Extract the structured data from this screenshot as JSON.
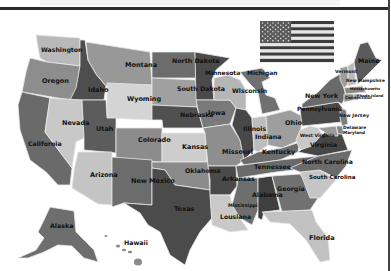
{
  "map": {
    "title": "United States map",
    "colors": {
      "background": "#ffffff",
      "state_border": "#e8e8e8",
      "label": "#111111",
      "top_rule": "#2b2b2b"
    },
    "flag": {
      "name": "us-flag",
      "x": 260,
      "y": 21,
      "w": 74,
      "h": 41
    },
    "states": [
      {
        "id": "WA",
        "label": "Washington",
        "fill": "#b9b9b9",
        "lx": 41,
        "ly": 52,
        "fs": 6.2,
        "points": "36,35 80,38 80,66 47,62 40,58 38,48"
      },
      {
        "id": "OR",
        "label": "Oregon",
        "fill": "#8d8d8d",
        "lx": 42,
        "ly": 83,
        "fs": 6.5,
        "points": "30,58 47,62 80,66 76,92 70,100 22,92 26,72"
      },
      {
        "id": "CA",
        "label": "California",
        "fill": "#6a6a6a",
        "lx": 28,
        "ly": 146,
        "fs": 6.2,
        "points": "22,92 50,98 45,132 72,168 70,185 58,185 46,172 30,160 20,130 18,105"
      },
      {
        "id": "ID",
        "label": "Idaho",
        "fill": "#4e4e4e",
        "lx": 88,
        "ly": 92,
        "fs": 6.5,
        "points": "80,40 85,40 88,60 96,74 106,86 104,100 70,100 76,88 80,66"
      },
      {
        "id": "NV",
        "label": "Nevada",
        "fill": "#c8c8c8",
        "lx": 62,
        "ly": 125,
        "fs": 6.5,
        "points": "50,98 82,100 84,138 76,142 72,168 45,132"
      },
      {
        "id": "MT",
        "label": "Montana",
        "fill": "#989898",
        "lx": 125,
        "ly": 67,
        "fs": 6.5,
        "points": "86,42 150,52 152,85 106,86 96,74 88,60"
      },
      {
        "id": "WY",
        "label": "Wyoming",
        "fill": "#d4d4d4",
        "lx": 127,
        "ly": 101,
        "fs": 6.5,
        "points": "107,83 152,85 152,120 107,118"
      },
      {
        "id": "UT",
        "label": "Utah",
        "fill": "#5c5c5c",
        "lx": 96,
        "ly": 131,
        "fs": 6.5,
        "points": "82,100 106,100 107,118 116,118 116,153 84,150 84,138"
      },
      {
        "id": "AZ",
        "label": "Arizona",
        "fill": "#c4c4c4",
        "lx": 90,
        "ly": 177,
        "fs": 6.5,
        "points": "78,152 112,152 112,205 98,204 72,188 74,170"
      },
      {
        "id": "CO",
        "label": "Colorado",
        "fill": "#8c8c8c",
        "lx": 138,
        "ly": 142,
        "fs": 6.5,
        "points": "116,128 162,128 162,162 116,160"
      },
      {
        "id": "NM",
        "label": "New Mexico",
        "fill": "#6c6c6c",
        "lx": 131,
        "ly": 183,
        "fs": 6.5,
        "points": "112,157 152,160 152,205 124,203 112,207"
      },
      {
        "id": "ND",
        "label": "North Dakota",
        "fill": "#6c6c6c",
        "lx": 172,
        "ly": 63,
        "fs": 6.3,
        "points": "152,52 195,52 196,78 152,78"
      },
      {
        "id": "SD",
        "label": "South Dakota",
        "fill": "#a0a0a0",
        "lx": 177,
        "ly": 91,
        "fs": 6.3,
        "points": "152,78 196,80 197,107 152,105"
      },
      {
        "id": "NE",
        "label": "Nebraska",
        "fill": "#505050",
        "lx": 180,
        "ly": 117,
        "fs": 6.3,
        "points": "152,105 197,107 203,128 163,128 162,120 152,120"
      },
      {
        "id": "KS",
        "label": "Kansas",
        "fill": "#cdcdcd",
        "lx": 182,
        "ly": 149,
        "fs": 6.5,
        "points": "162,133 205,133 207,162 162,162"
      },
      {
        "id": "OK",
        "label": "Oklahoma",
        "fill": "#8a8a8a",
        "lx": 185,
        "ly": 173,
        "fs": 6.3,
        "points": "152,162 208,162 210,190 190,187 175,185 165,170 152,168"
      },
      {
        "id": "TX",
        "label": "Texas",
        "fill": "#4b4b4b",
        "lx": 174,
        "ly": 211,
        "fs": 6.5,
        "points": "152,168 165,170 175,185 210,190 212,218 200,232 190,250 185,265 170,255 160,232 148,225 140,213 124,203 152,205"
      },
      {
        "id": "MN",
        "label": "Minnesota",
        "fill": "#4a4a4a",
        "lx": 205,
        "ly": 75,
        "fs": 6,
        "points": "195,52 230,58 216,70 212,80 214,100 196,100"
      },
      {
        "id": "IA",
        "label": "Iowa",
        "fill": "#7a7a7a",
        "lx": 208,
        "ly": 115,
        "fs": 6.5,
        "points": "196,100 230,100 236,108 230,124 203,128 198,110"
      },
      {
        "id": "MO",
        "label": "Missouri",
        "fill": "#8e8e8e",
        "lx": 222,
        "ly": 154,
        "fs": 6.5,
        "points": "203,128 230,124 240,140 244,160 236,166 208,166 205,133"
      },
      {
        "id": "AR",
        "label": "Arkansas",
        "fill": "#4a4a4a",
        "lx": 222,
        "ly": 181,
        "fs": 6.3,
        "points": "208,166 236,166 237,186 230,195 210,195 210,180"
      },
      {
        "id": "LA",
        "label": "Lousiana",
        "fill": "#c9c9c9",
        "lx": 220,
        "ly": 219,
        "fs": 6.2,
        "points": "210,195 230,195 232,205 240,218 248,230 230,232 212,225"
      },
      {
        "id": "WI",
        "label": "Wisconsin",
        "fill": "#b6b6b6",
        "lx": 232,
        "ly": 93,
        "fs": 6.2,
        "points": "214,78 228,75 240,80 246,90 246,110 236,108 230,100 214,100"
      },
      {
        "id": "IL",
        "label": "Illinois",
        "fill": "#484848",
        "lx": 243,
        "ly": 131,
        "fs": 6.2,
        "points": "236,108 246,110 252,118 254,150 244,160 240,140 232,125"
      },
      {
        "id": "MI",
        "label": "Michigan",
        "fill": "#707070",
        "lx": 247,
        "ly": 75,
        "fs": 6,
        "points": "240,72 262,68 270,78 262,82 266,95 275,98 280,110 262,114 258,92 250,84"
      },
      {
        "id": "IN",
        "label": "Indiana",
        "fill": "#bdbdbd",
        "lx": 255,
        "ly": 139,
        "fs": 6.3,
        "points": "252,118 266,116 268,145 258,152 254,150"
      },
      {
        "id": "OH",
        "label": "Ohio",
        "fill": "#9e9e9e",
        "lx": 285,
        "ly": 125,
        "fs": 6.5,
        "points": "266,116 290,110 302,116 300,140 282,148 268,145"
      },
      {
        "id": "KY",
        "label": "Kentucky",
        "fill": "#6c6c6c",
        "lx": 262,
        "ly": 154,
        "fs": 6.3,
        "points": "240,160 258,152 282,148 300,142 298,152 280,160 244,165"
      },
      {
        "id": "TN",
        "label": "Tennessee",
        "fill": "#6a6a6a",
        "lx": 254,
        "ly": 169,
        "fs": 6.3,
        "points": "236,166 280,160 318,156 312,168 276,172 238,178"
      },
      {
        "id": "MS",
        "label": "Mississippi",
        "fill": "#6e6e6e",
        "lx": 228,
        "ly": 207,
        "fs": 4.8,
        "points": "238,178 258,178 258,210 252,225 240,218 232,205 237,186"
      },
      {
        "id": "AL",
        "label": "Alabama",
        "fill": "#3f3f3f",
        "lx": 252,
        "ly": 197,
        "fs": 6.3,
        "points": "258,178 272,176 280,210 264,212 262,220 258,218"
      },
      {
        "id": "GA",
        "label": "Georgia",
        "fill": "#717171",
        "lx": 277,
        "ly": 191,
        "fs": 6.3,
        "points": "272,176 300,174 318,198 310,210 282,212"
      },
      {
        "id": "FL",
        "label": "Florida",
        "fill": "#c2c2c2",
        "lx": 309,
        "ly": 240,
        "fs": 6.5,
        "points": "262,212 312,210 316,222 328,238 330,260 320,262 306,240 290,224 270,222"
      },
      {
        "id": "SC",
        "label": "South Carolina",
        "fill": "#c5c5c5",
        "lx": 309,
        "ly": 179,
        "fs": 5.6,
        "points": "300,172 320,170 336,180 320,198 310,198"
      },
      {
        "id": "NC",
        "label": "North Carolina",
        "fill": "#6b6b6b",
        "lx": 302,
        "ly": 164,
        "fs": 6.2,
        "points": "290,168 318,156 352,150 346,166 336,178 320,170 300,172"
      },
      {
        "id": "VA",
        "label": "Virginia",
        "fill": "#474747",
        "lx": 310,
        "ly": 147,
        "fs": 6.2,
        "points": "298,152 318,138 330,128 342,134 348,150 318,156"
      },
      {
        "id": "WV",
        "label": "West Virginia",
        "fill": "#c8c8c8",
        "lx": 300,
        "ly": 137,
        "fs": 4.6,
        "points": "300,130 310,126 318,128 322,134 312,146 300,150 296,140"
      },
      {
        "id": "PA",
        "label": "Pennsylvania",
        "fill": "#4a4a4a",
        "lx": 297,
        "ly": 111,
        "fs": 6,
        "points": "300,108 338,102 344,110 342,122 302,126"
      },
      {
        "id": "NY",
        "label": "New York",
        "fill": "#6a6a6a",
        "lx": 305,
        "ly": 98,
        "fs": 6.3,
        "points": "302,104 318,92 330,80 340,74 346,96 342,104 338,102 302,108"
      },
      {
        "id": "NJ",
        "label": "New Jersey",
        "fill": "#7e7e7e",
        "lx": 339,
        "ly": 117,
        "fs": 4.8,
        "points": "340,108 346,110 348,124 342,126 340,118"
      },
      {
        "id": "DE",
        "label": "Delaware",
        "fill": "#888888",
        "lx": 343,
        "ly": 129,
        "fs": 4.4,
        "points": "336,126 342,126 344,134 338,134"
      },
      {
        "id": "MD",
        "label": "Maryland",
        "fill": "#9a9a9a",
        "lx": 343,
        "ly": 134,
        "fs": 4.2,
        "points": "318,128 336,126 338,136 330,136"
      },
      {
        "id": "VT",
        "label": "Vermont",
        "fill": "#9d9d9d",
        "lx": 335,
        "ly": 73,
        "fs": 4.6,
        "points": "340,68 348,66 348,84 344,88 340,80"
      },
      {
        "id": "NH",
        "label": "New Hampshire",
        "fill": "#bababa",
        "lx": 346,
        "ly": 82,
        "fs": 4.4,
        "points": "348,66 354,62 356,84 348,86"
      },
      {
        "id": "MA",
        "label": "Massachusetts",
        "fill": "#878787",
        "lx": 350,
        "ly": 90,
        "fs": 3.6,
        "points": "344,88 362,86 366,92 346,94"
      },
      {
        "id": "CT",
        "label": "Connecticut",
        "fill": "#8c8c8c",
        "lx": 345,
        "ly": 99,
        "fs": 4,
        "points": "344,94 354,94 354,100 344,102"
      },
      {
        "id": "RI",
        "label": "Rhode Island",
        "fill": "#9a9a9a",
        "lx": 357,
        "ly": 97,
        "fs": 3.6,
        "points": "354,94 358,94 358,100 354,100"
      },
      {
        "id": "ME",
        "label": "Maine",
        "fill": "#5a5a5a",
        "lx": 358,
        "ly": 63,
        "fs": 6.3,
        "points": "354,62 360,44 368,42 376,58 382,60 366,76 358,84"
      },
      {
        "id": "AK",
        "label": "Alaska",
        "fill": "#6e6e6e",
        "lx": 50,
        "ly": 228,
        "fs": 6.3,
        "points": "50,207 74,211 76,232 94,250 98,262 84,258 72,246 58,245 44,252 28,258 18,258 36,250 44,238 38,232 44,220"
      },
      {
        "id": "HI",
        "label": "Hawaii",
        "fill": "#ffffff",
        "lx": 124,
        "ly": 245,
        "fs": 6.3,
        "points": ""
      }
    ],
    "hawaii_islands": [
      {
        "cx": 106,
        "cy": 236,
        "rx": 1.5,
        "ry": 1
      },
      {
        "cx": 118,
        "cy": 246,
        "rx": 2,
        "ry": 1.5
      },
      {
        "cx": 124,
        "cy": 250,
        "rx": 2,
        "ry": 1.3
      },
      {
        "cx": 130,
        "cy": 252,
        "rx": 2.2,
        "ry": 1.3
      },
      {
        "cx": 138,
        "cy": 262,
        "rx": 4,
        "ry": 3.5
      }
    ]
  }
}
